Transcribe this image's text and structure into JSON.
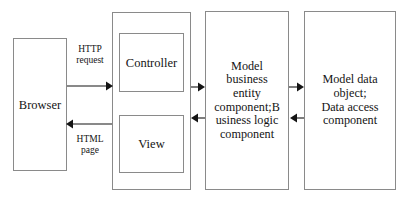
{
  "diagram": {
    "background_color": "#ffffff",
    "border_color": "#8a8a8a",
    "arrow_color": "#141414",
    "nodes": {
      "browser": {
        "label": "Browser"
      },
      "mvc_container": {
        "label": ""
      },
      "controller": {
        "label": "Controller"
      },
      "view": {
        "label": "View"
      },
      "model_business": {
        "label": "Model\nbusiness\nentity\ncomponent;B\nusiness logic\ncomponent"
      },
      "model_data": {
        "label": "Model data\nobject;\nData access\ncomponent"
      }
    },
    "edges": [
      {
        "id": "http-request",
        "from": "browser",
        "to": "controller",
        "label": "HTTP\nrequest",
        "direction": "right"
      },
      {
        "id": "html-page",
        "from": "view",
        "to": "browser",
        "label": "HTML\npage",
        "direction": "left"
      },
      {
        "id": "controller-to-model",
        "from": "controller",
        "to": "model_business",
        "label": "",
        "direction": "right"
      },
      {
        "id": "model-to-view",
        "from": "model_business",
        "to": "view",
        "label": "",
        "direction": "left"
      },
      {
        "id": "model-to-data",
        "from": "model_business",
        "to": "model_data",
        "label": "",
        "direction": "right"
      },
      {
        "id": "data-to-model",
        "from": "model_data",
        "to": "model_business",
        "label": "",
        "direction": "left"
      }
    ]
  }
}
